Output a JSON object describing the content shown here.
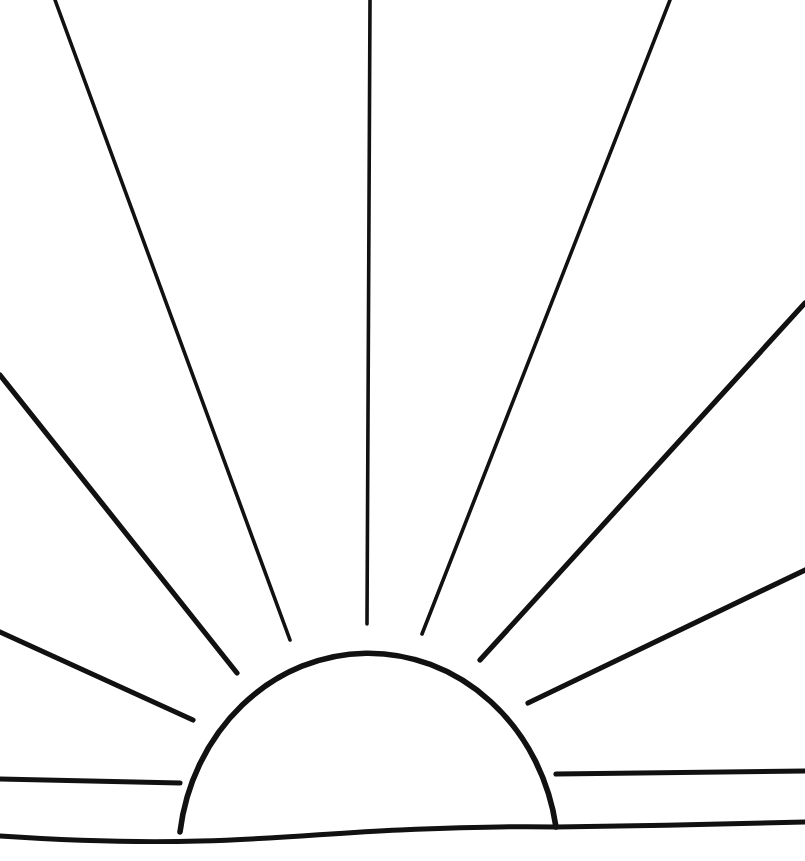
{
  "artwork": {
    "title": "Sunrise",
    "description": "Line drawing of a rising sun: a semicircular dome on a horizon line with eleven straight rays radiating outward.",
    "medium": "black ink line drawing on white ground",
    "canvas": {
      "width": 805,
      "height": 861
    },
    "colors": {
      "background": "#ffffff",
      "ink": "#111111",
      "sun_fill": "#ffffff"
    }
  },
  "sun": {
    "label": "sun-dome",
    "center_x": 368,
    "base_y": 830,
    "radius": 190,
    "apex": {
      "x": 367,
      "y": 624
    },
    "base_left": {
      "x": 180,
      "y": 832
    },
    "base_right": {
      "x": 556,
      "y": 827
    },
    "arc_path": "M 180 832 A 190 206 0 0 1 556 827",
    "outline_width": 5.6
  },
  "horizon": {
    "label": "horizon-line",
    "path": "M 0 836 C 60 840 130 843 200 841 C 280 839 330 833 400 830 C 470 827 520 826 556 827 C 640 826 720 824 805 822",
    "stroke_width": 5.0,
    "left_y": 836,
    "right_y": 822
  },
  "rays": [
    {
      "id": "ray-left-horizontal",
      "name": "ray-left-horizontal",
      "angle_label": "180 deg",
      "weight": "thick",
      "path": "M 0 779 L 180 783"
    },
    {
      "id": "ray-left-low",
      "name": "ray-left-low",
      "angle_label": "200 deg",
      "weight": "thick",
      "path": "M 0 632 L 193 720"
    },
    {
      "id": "ray-left-mid",
      "name": "ray-left-mid",
      "angle_label": "222 deg",
      "weight": "thick",
      "path": "M 0 375 L 237 673"
    },
    {
      "id": "ray-left-upper",
      "name": "ray-left-upper",
      "angle_label": "248 deg",
      "weight": "normal",
      "path": "M 55 0 L 290 640"
    },
    {
      "id": "ray-vertical",
      "name": "ray-vertical-center",
      "angle_label": "270 deg",
      "weight": "normal",
      "path": "M 370 0 L 367 624"
    },
    {
      "id": "ray-right-upper",
      "name": "ray-right-upper",
      "angle_label": "292 deg",
      "weight": "normal",
      "path": "M 670 0 L 422 634"
    },
    {
      "id": "ray-right-mid",
      "name": "ray-right-mid",
      "angle_label": "315 deg",
      "weight": "thick",
      "path": "M 805 303 L 480 660"
    },
    {
      "id": "ray-right-low",
      "name": "ray-right-low",
      "angle_label": "338 deg",
      "weight": "thick",
      "path": "M 805 570 L 528 703"
    },
    {
      "id": "ray-right-horizontal",
      "name": "ray-right-horizontal",
      "angle_label": "0 deg",
      "weight": "thick",
      "path": "M 556 774 L 805 771"
    }
  ],
  "ray_count": 9,
  "notes": {
    "style": "hand-drawn, slightly irregular strokes",
    "symmetry": "approximately bilaterally symmetric about the vertical center ray"
  }
}
